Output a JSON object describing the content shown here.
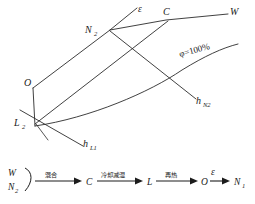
{
  "figure": {
    "chart": {
      "points": {
        "N2": "N",
        "N2_sub": "2",
        "C": "C",
        "W": "W",
        "O": "O",
        "L2": "L",
        "L2_sub": "2",
        "epsilon": "ε",
        "saturation": "φ=100%",
        "h_N2": "h",
        "h_N2_sub": "N2",
        "h_L1": "h",
        "h_L1_sub": "L1"
      }
    },
    "flow": {
      "source_top": "W",
      "source_bottom": "N",
      "source_bottom_sub": "2",
      "steps": [
        {
          "process": "混合",
          "target": "C"
        },
        {
          "process": "冷却减湿",
          "target": "L"
        },
        {
          "process": "再热",
          "target": "O"
        }
      ],
      "final_process": "ε",
      "final_target": "N",
      "final_target_sub": "1"
    },
    "colors": {
      "ink": "#2b2b2b",
      "background": "#ffffff"
    }
  }
}
